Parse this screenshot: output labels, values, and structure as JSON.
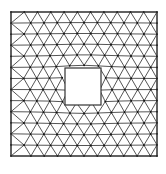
{
  "diagram": {
    "type": "triangular-mesh",
    "outer_boundary": {
      "x0": 11,
      "y0": 12,
      "x1": 157,
      "y1": 156
    },
    "inner_hole": {
      "x0": 65,
      "y0": 68,
      "x1": 101,
      "y1": 105
    },
    "grid": {
      "cols": 11,
      "rows": 13
    },
    "colors": {
      "background": "#ffffff",
      "edge": "#2a2a2a",
      "boundary": "#333333",
      "node": "#111111"
    }
  }
}
